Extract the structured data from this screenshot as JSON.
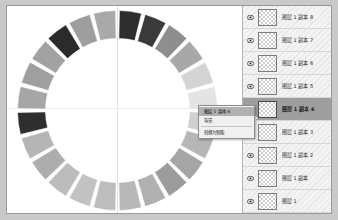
{
  "window": {
    "background_color": "#c9c9c9",
    "frame_border_color": "#9a9a9a",
    "canvas_background": "#ffffff"
  },
  "canvas": {
    "guide_vertical_label": "vertical-guide",
    "guide_horizontal_label": "horizontal-guide",
    "guide_color": "#e3e3e3"
  },
  "chart_data": {
    "type": "pie",
    "title": "",
    "subtitle": "",
    "xlabel": "",
    "ylabel": "",
    "shape": "donut-ring",
    "inner_radius_ratio": 0.72,
    "segment_count": 24,
    "gap_degrees": 2.2,
    "start_angle_degrees": -90,
    "categories": [
      "seg-1",
      "seg-2",
      "seg-3",
      "seg-4",
      "seg-5",
      "seg-6",
      "seg-7",
      "seg-8",
      "seg-9",
      "seg-10",
      "seg-11",
      "seg-12",
      "seg-13",
      "seg-14",
      "seg-15",
      "seg-16",
      "seg-17",
      "seg-18",
      "seg-19",
      "seg-20",
      "seg-21",
      "seg-22",
      "seg-23",
      "seg-24"
    ],
    "values": [
      1,
      1,
      1,
      1,
      1,
      1,
      1,
      1,
      1,
      1,
      1,
      1,
      1,
      1,
      1,
      1,
      1,
      1,
      1,
      1,
      1,
      1,
      1,
      1
    ],
    "colors": [
      "#2d2d2d",
      "#3a3a3a",
      "#8e8e8e",
      "#a8a8a8",
      "#d4d4d4",
      "#e4e4e4",
      "#d0d0d0",
      "#b6b6b6",
      "#a5a5a5",
      "#9c9c9c",
      "#b0b0b0",
      "#b8b8b8",
      "#bdbdbd",
      "#c2c2c2",
      "#bcbcbc",
      "#adadad",
      "#b5b5b5",
      "#2e2e2e",
      "#a6a6a6",
      "#9f9f9f",
      "#a2a2a2",
      "#2b2b2b",
      "#9e9e9e",
      "#a9a9a9"
    ],
    "grid": false,
    "legend_position": "none",
    "stroke_color": "#ffffff"
  },
  "context_menu": {
    "visible": true,
    "items": [
      {
        "label": "图层 1 副本 4",
        "highlighted": true
      },
      {
        "label": "背景",
        "highlighted": false
      },
      {
        "label": "转换为智能",
        "highlighted": false
      }
    ]
  },
  "layers_panel": {
    "title": "",
    "background_color": "#f3f3f3",
    "selected_row_color": "#9e9e9e",
    "rows": [
      {
        "name": "图层 1 副本 8",
        "visible": true,
        "selected": false,
        "eye_icon": "eye-icon"
      },
      {
        "name": "图层 1 副本 7",
        "visible": true,
        "selected": false,
        "eye_icon": "eye-icon"
      },
      {
        "name": "图层 1 副本 6",
        "visible": true,
        "selected": false,
        "eye_icon": "eye-icon"
      },
      {
        "name": "图层 1 副本 5",
        "visible": true,
        "selected": false,
        "eye_icon": "eye-icon"
      },
      {
        "name": "图层 1 副本 4",
        "visible": true,
        "selected": true,
        "eye_icon": "eye-icon"
      },
      {
        "name": "图层 1 副本 3",
        "visible": true,
        "selected": false,
        "eye_icon": "eye-icon"
      },
      {
        "name": "图层 1 副本 2",
        "visible": true,
        "selected": false,
        "eye_icon": "eye-icon"
      },
      {
        "name": "图层 1 副本",
        "visible": true,
        "selected": false,
        "eye_icon": "eye-icon"
      },
      {
        "name": "图层 1",
        "visible": true,
        "selected": false,
        "eye_icon": "eye-icon"
      }
    ]
  }
}
